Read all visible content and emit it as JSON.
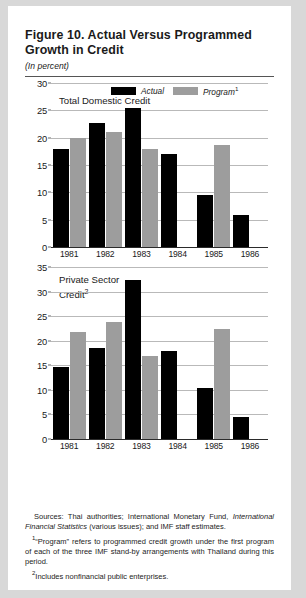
{
  "figure": {
    "title": "Figure 10.  Actual Versus Programmed Growth in Credit",
    "subtitle": "(In percent)"
  },
  "legend": {
    "actual_label": "Actual",
    "program_label": "Program",
    "program_footnote_marker": "1",
    "actual_color": "#000000",
    "program_color": "#9d9d9d"
  },
  "notes": {
    "sources_lead": "Sources:  Thai authorities; International Monetary Fund, ",
    "sources_italic": "International Financial Statistics",
    "sources_tail": " (various issues); and IMF staff estimates.",
    "footnote1_marker": "1",
    "footnote1": "“Program” refers to programmed credit growth under the first program of each of the three IMF stand-by arrangements with Thailand during this period.",
    "footnote2_marker": "2",
    "footnote2": "Includes nonfinancial public enterprises."
  },
  "chart_data": [
    {
      "type": "bar",
      "id": "total-domestic-credit",
      "title": "Total Domestic Credit",
      "title_footnote_marker": "",
      "xlabel": "",
      "ylabel": "",
      "ylim": [
        0,
        30
      ],
      "yticks": [
        0,
        5,
        10,
        15,
        20,
        25,
        30
      ],
      "ytick_labels": [
        "0",
        "5",
        "10",
        "15",
        "20",
        "25",
        "30"
      ],
      "grid": true,
      "legend_position": "top",
      "categories": [
        "1981",
        "1982",
        "1983",
        "1984",
        "1985",
        "1986"
      ],
      "series": [
        {
          "name": "Actual",
          "color": "#000000",
          "values": [
            18.0,
            22.6,
            25.5,
            17.0,
            9.5,
            5.8
          ]
        },
        {
          "name": "Program",
          "color": "#9d9d9d",
          "values": [
            20.0,
            21.0,
            18.0,
            null,
            18.7,
            null
          ]
        }
      ]
    },
    {
      "type": "bar",
      "id": "private-sector-credit",
      "title": "Private Sector Credit",
      "title_footnote_marker": "2",
      "xlabel": "",
      "ylabel": "",
      "ylim": [
        0,
        35
      ],
      "yticks": [
        0,
        5,
        10,
        15,
        20,
        25,
        30,
        35
      ],
      "ytick_labels": [
        "0",
        "5",
        "10",
        "15",
        "20",
        "25",
        "30",
        "35"
      ],
      "grid": true,
      "legend_position": "none",
      "categories": [
        "1981",
        "1982",
        "1983",
        "1984",
        "1985",
        "1986"
      ],
      "series": [
        {
          "name": "Actual",
          "color": "#000000",
          "values": [
            14.6,
            18.5,
            32.3,
            18.0,
            10.3,
            4.5
          ]
        },
        {
          "name": "Program",
          "color": "#9d9d9d",
          "values": [
            21.8,
            23.8,
            16.9,
            null,
            22.4,
            null
          ]
        }
      ]
    }
  ]
}
